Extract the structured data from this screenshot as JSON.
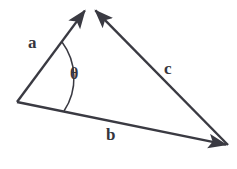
{
  "diagram": {
    "background_color": "#ffffff",
    "stroke_color": "#3a3a42",
    "label_color": "#35353d",
    "labels": {
      "vector_a": "a",
      "vector_b": "b",
      "vector_c": "c",
      "angle_theta": "θ"
    },
    "vertices": {
      "origin": {
        "x": 17,
        "y": 102
      },
      "apex": {
        "x": 89,
        "y": 8
      },
      "right": {
        "x": 228,
        "y": 145
      }
    },
    "vectors": [
      {
        "name": "a",
        "label": "a",
        "from": {
          "x": 17,
          "y": 102
        },
        "to": {
          "x": 86,
          "y": 9
        },
        "arrowhead": "end",
        "label_position": {
          "x": 28,
          "y": 34
        }
      },
      {
        "name": "b",
        "label": "b",
        "from": {
          "x": 17,
          "y": 102
        },
        "to": {
          "x": 228,
          "y": 145
        },
        "arrowhead": "end",
        "label_position": {
          "x": 106,
          "y": 126
        }
      },
      {
        "name": "c",
        "label": "c",
        "from": {
          "x": 228,
          "y": 145
        },
        "to": {
          "x": 94,
          "y": 9
        },
        "arrowhead": "end",
        "label_position": {
          "x": 164,
          "y": 60
        }
      }
    ],
    "angle_arc": {
      "name": "theta",
      "label": "θ",
      "center": {
        "x": 17,
        "y": 102
      },
      "radius": 60,
      "start_point": {
        "x": 62,
        "y": 42
      },
      "end_point": {
        "x": 64,
        "y": 111
      },
      "label_position": {
        "x": 70,
        "y": 66
      }
    }
  }
}
